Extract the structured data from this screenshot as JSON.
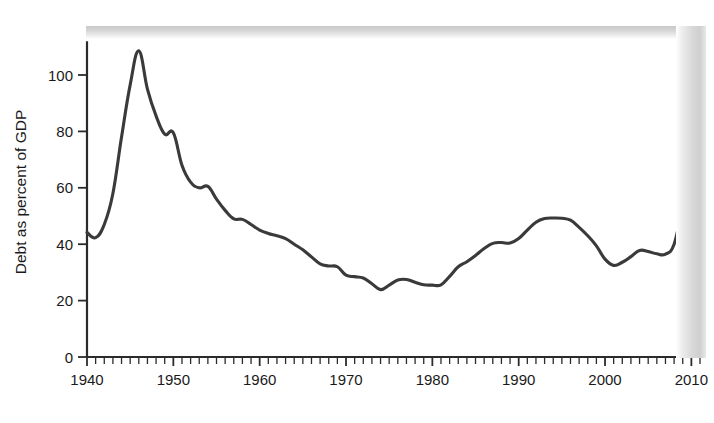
{
  "chart_data": {
    "type": "line",
    "title": "",
    "subtitle": "",
    "xlabel": "",
    "ylabel": "Debt as percent of GDP",
    "xlim": [
      1940,
      2011
    ],
    "ylim": [
      0,
      112
    ],
    "grid": false,
    "legend": null,
    "y_ticks": [
      0,
      20,
      40,
      60,
      80,
      100
    ],
    "y_tick_labels": [
      "0",
      "20",
      "40",
      "60",
      "80",
      "100"
    ],
    "x_ticks": [
      1940,
      1950,
      1960,
      1970,
      1980,
      1990,
      2000,
      2010
    ],
    "x_tick_labels": [
      "1940",
      "1950",
      "1960",
      "1970",
      "1980",
      "1990",
      "2000",
      "2010"
    ],
    "x_minor_tick_interval": 1,
    "series": [
      {
        "name": "Debt as percent of GDP",
        "color": "#3a3a3a",
        "x": [
          1940,
          1941,
          1942,
          1943,
          1944,
          1945,
          1946,
          1947,
          1948,
          1949,
          1950,
          1951,
          1952,
          1953,
          1954,
          1955,
          1956,
          1957,
          1958,
          1959,
          1960,
          1961,
          1962,
          1963,
          1964,
          1965,
          1966,
          1967,
          1968,
          1969,
          1970,
          1971,
          1972,
          1973,
          1974,
          1975,
          1976,
          1977,
          1978,
          1979,
          1980,
          1981,
          1982,
          1983,
          1984,
          1985,
          1986,
          1987,
          1988,
          1989,
          1990,
          1991,
          1992,
          1993,
          1994,
          1995,
          1996,
          1997,
          1998,
          1999,
          2000,
          2001,
          2002,
          2003,
          2004,
          2005,
          2006,
          2007,
          2008,
          2009,
          2010
        ],
        "values": [
          44.2,
          42.3,
          47.0,
          58.0,
          78.0,
          96.5,
          108.6,
          95.0,
          85.5,
          79.0,
          79.5,
          68.0,
          62.0,
          60.0,
          60.5,
          56.0,
          52.0,
          49.0,
          48.8,
          47.0,
          45.0,
          43.8,
          43.0,
          42.0,
          40.0,
          38.0,
          35.5,
          33.0,
          32.3,
          32.0,
          29.0,
          28.5,
          28.0,
          26.0,
          23.9,
          25.5,
          27.3,
          27.5,
          26.5,
          25.6,
          25.5,
          25.6,
          28.6,
          32.0,
          33.8,
          36.0,
          38.5,
          40.3,
          40.6,
          40.4,
          42.0,
          45.0,
          47.8,
          49.1,
          49.3,
          49.2,
          48.5,
          46.0,
          43.0,
          39.4,
          34.7,
          32.5,
          33.6,
          35.6,
          37.8,
          37.4,
          36.6,
          36.5,
          40.0,
          53.5,
          66.0
        ]
      }
    ]
  },
  "figure": {
    "background": "#ffffff",
    "line_color": "#3a3a3a",
    "axis_color": "#2b2b2b",
    "text_color": "#1a1a1a"
  }
}
